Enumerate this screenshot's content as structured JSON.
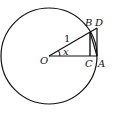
{
  "diagram": {
    "points": {
      "O": "O",
      "A": "A",
      "B": "B",
      "C": "C",
      "D": "D"
    },
    "radius_label": "1",
    "angle_label": "x",
    "colors": {
      "stroke": "#111111",
      "background": "#ffffff"
    }
  }
}
